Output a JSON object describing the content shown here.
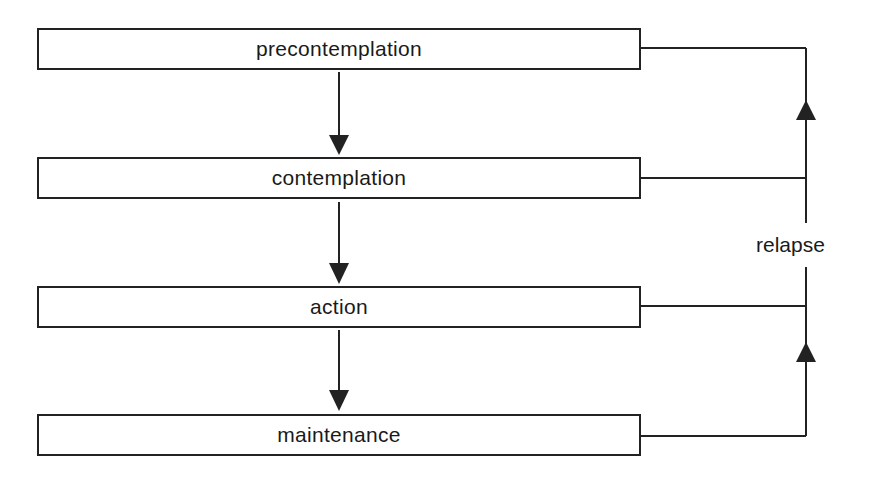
{
  "diagram": {
    "stages": [
      {
        "label": "precontemplation"
      },
      {
        "label": "contemplation"
      },
      {
        "label": "action"
      },
      {
        "label": "maintenance"
      }
    ],
    "feedback_label": "relapse",
    "colors": {
      "line": "#222222",
      "background": "#ffffff",
      "text": "#1a1a1a"
    }
  }
}
